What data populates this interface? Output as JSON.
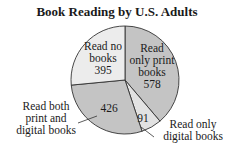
{
  "chart_data": {
    "type": "pie",
    "title": "Book Reading by U.S. Adults",
    "categories": [
      "Read only print books",
      "Read only digital books",
      "Read both print and digital books",
      "Read no books"
    ],
    "values": [
      578,
      91,
      426,
      395
    ],
    "colors": [
      "#c4c4c4",
      "#e2e2e2",
      "#c4c4c4",
      "#ececec"
    ],
    "labels": {
      "none": {
        "line1": "Read no",
        "line2": "books",
        "value": "395"
      },
      "print": {
        "line1": "Read",
        "line2": "only print",
        "line3": "books",
        "value": "578"
      },
      "digital": {
        "value": "91",
        "line1": "Read only",
        "line2": "digital books"
      },
      "both": {
        "value": "426",
        "line1": "Read both",
        "line2": "print and",
        "line3": "digital books"
      }
    }
  }
}
